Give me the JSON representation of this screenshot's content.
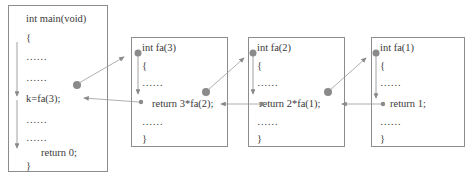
{
  "diagram": {
    "colors": {
      "box_border": "#8c8c8c",
      "arrow": "#8a8a8a",
      "dot": "#8a8a8a",
      "text": "#3a3a3a"
    },
    "main": {
      "lines": [
        "int main(void)",
        "{",
        "……",
        "……",
        "k=fa(3);",
        "……",
        "……",
        "return 0;",
        "}"
      ]
    },
    "frames": [
      {
        "id": "fa3",
        "lines": [
          "int fa(3)",
          "{",
          "……",
          "return 3*fa(2);",
          "……",
          "}"
        ]
      },
      {
        "id": "fa2",
        "lines": [
          "int fa(2)",
          "{",
          "……",
          "return 2*fa(1);",
          "……",
          "}"
        ]
      },
      {
        "id": "fa1",
        "lines": [
          "int fa(1)",
          "{",
          "……",
          "return 1;",
          "……",
          "}"
        ]
      }
    ],
    "arrows": {
      "calls": [
        {
          "from": "main: k=fa(3)",
          "to": "fa(3) entry"
        },
        {
          "from": "fa(3): return 3*fa(2)",
          "to": "fa(2) entry"
        },
        {
          "from": "fa(2): return 2*fa(1)",
          "to": "fa(1) entry"
        }
      ],
      "returns": [
        {
          "from": "fa(1): return 1",
          "to": "fa(2)"
        },
        {
          "from": "fa(2): return 2*fa(1)",
          "to": "fa(3)"
        },
        {
          "from": "fa(3): return 3*fa(2)",
          "to": "main: k=fa(3)"
        }
      ]
    },
    "caption": ""
  }
}
